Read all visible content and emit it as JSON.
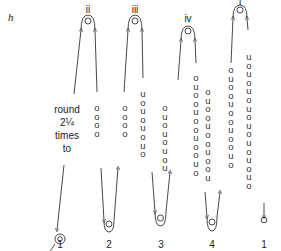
{
  "figure": {
    "label": "h",
    "instruction_lines": [
      "round",
      "2¼",
      "times",
      "to"
    ]
  },
  "columns": [
    {
      "top_label": "ii",
      "bottom_label": "1",
      "left_beads": [],
      "right_beads": [
        "o",
        "o",
        "o",
        "o"
      ]
    },
    {
      "top_label": "iii",
      "bottom_label": "2",
      "left_beads": [
        "o",
        "o",
        "o",
        "o"
      ],
      "right_beads": [
        "u",
        "o",
        "u",
        "o",
        "u",
        "o",
        "u",
        "o"
      ]
    },
    {
      "top_label": "iv",
      "bottom_label": "3",
      "left_beads": [
        "o",
        "u",
        "o",
        "u",
        "o",
        "u",
        "o",
        "u"
      ],
      "right_beads": [
        "o",
        "u",
        "o",
        "o",
        "u",
        "o",
        "o",
        "u",
        "o",
        "o",
        "u",
        "o"
      ]
    },
    {
      "top_label": "i",
      "bottom_label": "4",
      "left_beads": [
        "o",
        "u",
        "o",
        "o",
        "u",
        "o",
        "o",
        "u",
        "o",
        "o",
        "u",
        "o"
      ],
      "right_beads": [
        "u",
        "o",
        "u",
        "o",
        "u",
        "o",
        "u",
        "o",
        "u",
        "o",
        "u",
        "o"
      ]
    },
    {
      "top_label": "",
      "bottom_label": "1",
      "left_beads": [],
      "right_beads": []
    }
  ],
  "column_i_left_beads": [
    "o",
    "u",
    "o",
    "o",
    "u",
    "o",
    "o",
    "u",
    "o",
    "o",
    "u"
  ],
  "column_i_right_beads": [
    "u",
    "o",
    "u",
    "o",
    "u",
    "o",
    "u",
    "o",
    "u",
    "o",
    "u",
    "o",
    "u",
    "o",
    "u",
    "o"
  ],
  "colors": {
    "line": "#333333",
    "text": "#222222",
    "background": "#ffffff"
  }
}
